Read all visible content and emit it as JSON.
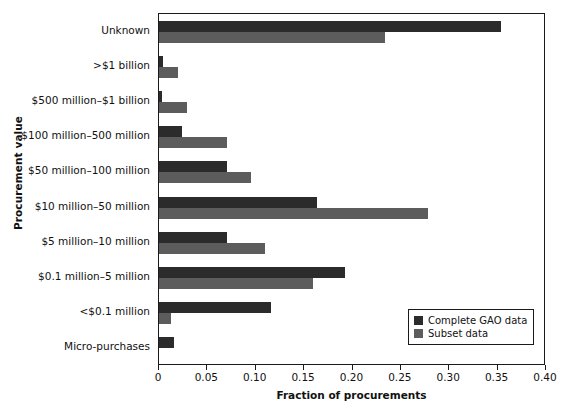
{
  "chart_data": {
    "type": "bar",
    "orientation": "horizontal",
    "title": "",
    "xlabel": "Fraction of procurements",
    "ylabel": "Procurement value",
    "xlim": [
      0,
      0.4
    ],
    "xticks": [
      "0",
      "0.05",
      "0.10",
      "0.15",
      "0.20",
      "0.25",
      "0.30",
      "0.35",
      "0.40"
    ],
    "xtick_values": [
      0,
      0.05,
      0.1,
      0.15,
      0.2,
      0.25,
      0.3,
      0.35,
      0.4
    ],
    "grid": false,
    "legend_position": "lower right",
    "categories": [
      "Unknown",
      ">$1 billion",
      "$500 million–$1 billion",
      "$100 million–500 million",
      "$50 million–100 million",
      "$10 million–50 million",
      "$5 million–10 million",
      "$0.1 million–5 million",
      "<$0.1 million",
      "Micro-purchases"
    ],
    "series": [
      {
        "name": "Complete GAO data",
        "color": "#2b2b2b",
        "values": [
          0.354,
          0.004,
          0.003,
          0.024,
          0.07,
          0.163,
          0.07,
          0.192,
          0.116,
          0.016
        ]
      },
      {
        "name": "Subset data",
        "color": "#5c5c5c",
        "values": [
          0.234,
          0.02,
          0.029,
          0.07,
          0.095,
          0.278,
          0.11,
          0.159,
          0.012,
          0.0
        ]
      }
    ]
  },
  "legend": {
    "items": [
      {
        "label": "Complete GAO data",
        "color": "#2b2b2b"
      },
      {
        "label": "Subset data",
        "color": "#5c5c5c"
      }
    ]
  }
}
